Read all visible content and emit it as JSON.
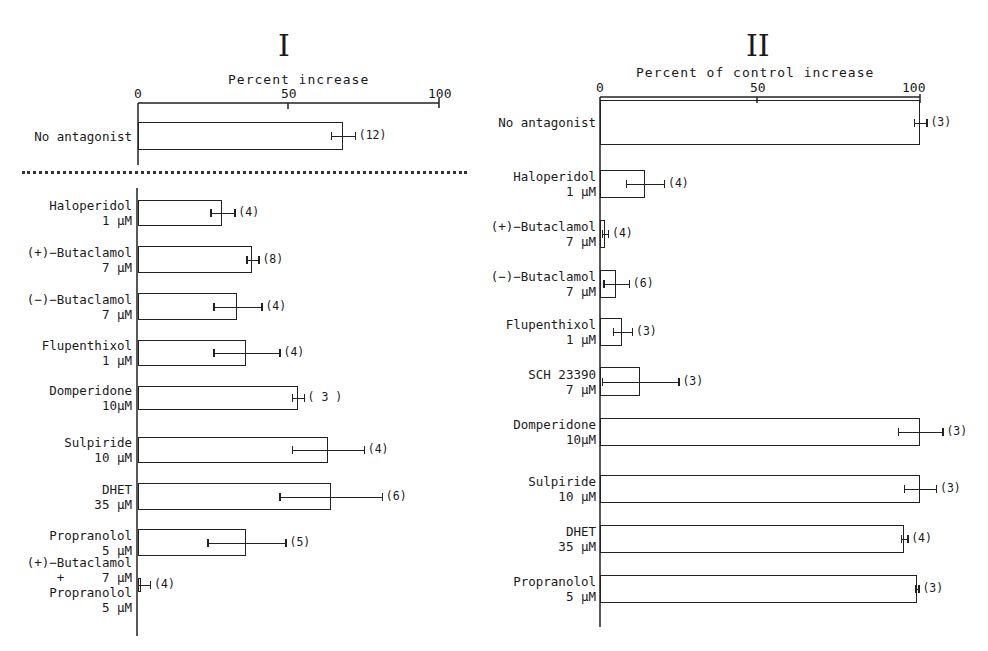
{
  "chart_data": [
    {
      "type": "bar",
      "orientation": "horizontal",
      "panel": "I",
      "title": "I",
      "xlabel": "Percent increase",
      "xticks": [
        0,
        50,
        100
      ],
      "xlim": [
        0,
        100
      ],
      "separator": "dotted line below No antagonist",
      "categories": [
        "No antagonist",
        "Haloperidol 1 µM",
        "(+)-Butaclamol 7 µM",
        "(−)-Butaclamol 7 µM",
        "Flupenthixol 1 µM",
        "Domperidone 10 µM",
        "Sulpiride 10 µM",
        "DHET 35 µM",
        "Propranolol 5 µM",
        "(+)-Butaclamol 7 µM + Propranolol 5 µM"
      ],
      "values": [
        68,
        28,
        38,
        33,
        36,
        53,
        63,
        64,
        36,
        1
      ],
      "error": [
        4,
        4,
        2,
        8,
        11,
        2,
        12,
        17,
        13,
        3
      ],
      "n": [
        "(12)",
        "(4)",
        "(8)",
        "(4)",
        "(4)",
        "(3)",
        "(4)",
        "(6)",
        "(5)",
        "(4)"
      ]
    },
    {
      "type": "bar",
      "orientation": "horizontal",
      "panel": "II",
      "title": "II",
      "xlabel": "Percent of control increase",
      "xticks": [
        0,
        50,
        100
      ],
      "xlim": [
        0,
        100
      ],
      "categories": [
        "No antagonist",
        "Haloperidol 1 µM",
        "(+)-Butaclamol 7 µM",
        "(−)-Butaclamol 7 µM",
        "Flupenthixol 1 µM",
        "SCH 23390 7 µM",
        "Domperidone 10 µM",
        "Sulpiride 10 µM",
        "DHET 35 µM",
        "Propranolol 5 µM"
      ],
      "values": [
        100,
        14,
        1.5,
        5,
        7,
        12.5,
        100,
        100,
        95,
        99
      ],
      "error": [
        2,
        6,
        1,
        4,
        3,
        12,
        7,
        5,
        1,
        0.5
      ],
      "n": [
        "(3)",
        "(4)",
        "(4)",
        "(6)",
        "(3)",
        "(3)",
        "(3)",
        "(3)",
        "(4)",
        "(3)"
      ]
    }
  ],
  "panel1": {
    "roman": "I",
    "axis_title": "Percent increase",
    "ticks": [
      "0",
      "50",
      "100"
    ],
    "rows": [
      {
        "label": "No antagonist",
        "value": 68,
        "err": 4,
        "n": "(12)"
      },
      {
        "label": "Haloperidol\n1 µM",
        "value": 28,
        "err": 4,
        "n": "(4)"
      },
      {
        "label": "(+)−Butaclamol\n7 µM",
        "value": 38,
        "err": 2,
        "n": "(8)"
      },
      {
        "label": "(−)−Butaclamol\n7 µM",
        "value": 33,
        "err": 8,
        "n": "(4)"
      },
      {
        "label": "Flupenthixol\n1 µM",
        "value": 36,
        "err": 11,
        "n": "(4)"
      },
      {
        "label": "Domperidone\n10µM",
        "value": 53,
        "err": 2,
        "n": "( 3 )"
      },
      {
        "label": "Sulpiride\n10 µM",
        "value": 63,
        "err": 12,
        "n": "(4)"
      },
      {
        "label": "DHET\n35 µM",
        "value": 64,
        "err": 17,
        "n": "(6)"
      },
      {
        "label": "Propranolol\n5 µM",
        "value": 36,
        "err": 13,
        "n": "(5)"
      },
      {
        "label": "(+)−Butaclamol\n+     7 µM\nPropranolol\n5 µM",
        "value": 1,
        "err": 3,
        "n": "(4)"
      }
    ]
  },
  "panel2": {
    "roman": "II",
    "axis_title": "Percent of control increase",
    "ticks": [
      "0",
      "50",
      "100"
    ],
    "rows": [
      {
        "label": "No antagonist",
        "value": 100,
        "err": 2,
        "n": "(3)"
      },
      {
        "label": "Haloperidol\n1 µM",
        "value": 14,
        "err": 6,
        "n": "(4)"
      },
      {
        "label": "(+)−Butaclamol\n7 µM",
        "value": 1.5,
        "err": 1,
        "n": "(4)"
      },
      {
        "label": "(−)−Butaclamol\n7 µM",
        "value": 5,
        "err": 4,
        "n": "(6)"
      },
      {
        "label": "Flupenthixol\n1 µM",
        "value": 7,
        "err": 3,
        "n": "(3)"
      },
      {
        "label": "SCH 23390\n7 µM",
        "value": 12.5,
        "err": 12,
        "n": "(3)"
      },
      {
        "label": "Domperidone\n10µM",
        "value": 100,
        "err": 7,
        "n": "(3)"
      },
      {
        "label": "Sulpiride\n10 µM",
        "value": 100,
        "err": 5,
        "n": "(3)"
      },
      {
        "label": "DHET\n35 µM",
        "value": 95,
        "err": 1,
        "n": "(4)"
      },
      {
        "label": "Propranolol\n5 µM",
        "value": 99,
        "err": 0.5,
        "n": "(3)"
      }
    ]
  }
}
